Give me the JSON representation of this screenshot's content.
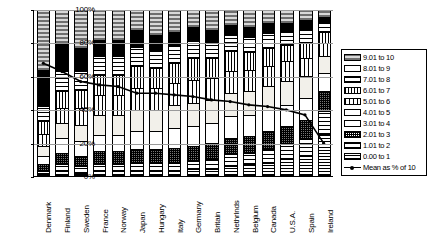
{
  "chart_data": {
    "type": "bar",
    "title": "",
    "xlabel": "",
    "ylabel": "",
    "ylim": [
      0,
      100
    ],
    "ytick_labels": [
      "0%",
      "20%",
      "40%",
      "60%",
      "80%",
      "100%"
    ],
    "ytick_values": [
      0,
      20,
      40,
      60,
      80,
      100
    ],
    "grid": true,
    "stacked": true,
    "normalized_percent": true,
    "legend_position": "right",
    "categories": [
      "Denmark",
      "Finland",
      "Sweden",
      "France",
      "Norway",
      "Japan",
      "Hungary",
      "Italy",
      "Germany",
      "Britain",
      "Nethrlnds",
      "Belgium",
      "Canada",
      "U.S.A.",
      "Spain",
      "Ireland"
    ],
    "series": [
      {
        "name": "9.01 to 10",
        "pattern": "grey-checker",
        "values": [
          36,
          20,
          23,
          18,
          18,
          12,
          15,
          13,
          10,
          12,
          9,
          10,
          8,
          8,
          6,
          4
        ]
      },
      {
        "name": "8.01 to 9",
        "pattern": "solid-black",
        "values": [
          22,
          17,
          14,
          10,
          10,
          10,
          9,
          8,
          8,
          7,
          6,
          6,
          6,
          5,
          6,
          3
        ]
      },
      {
        "name": "7.01 to 8",
        "pattern": "cross-hatch",
        "values": [
          9,
          12,
          11,
          11,
          11,
          12,
          11,
          11,
          11,
          10,
          10,
          9,
          9,
          8,
          8,
          6
        ]
      },
      {
        "name": "6.01 to 7",
        "pattern": "vertical-dense",
        "values": [
          8,
          10,
          11,
          12,
          12,
          13,
          12,
          12,
          13,
          12,
          12,
          11,
          11,
          10,
          9,
          7
        ]
      },
      {
        "name": "5.01 to 6",
        "pattern": "vertical-wide",
        "values": [
          7,
          9,
          10,
          12,
          12,
          13,
          13,
          13,
          14,
          13,
          13,
          13,
          12,
          12,
          11,
          8
        ]
      },
      {
        "name": "4.01 to 5",
        "pattern": "light-fill",
        "values": [
          6,
          9,
          10,
          12,
          12,
          13,
          13,
          14,
          14,
          14,
          14,
          14,
          14,
          14,
          13,
          10
        ]
      },
      {
        "name": "3.01 to 4",
        "pattern": "white-fill",
        "values": [
          5,
          9,
          9,
          10,
          10,
          11,
          11,
          12,
          12,
          12,
          13,
          13,
          13,
          13,
          13,
          11
        ]
      },
      {
        "name": "2.01 to 3",
        "pattern": "dark-speckle",
        "values": [
          4,
          7,
          6,
          8,
          8,
          8,
          8,
          9,
          9,
          10,
          10,
          10,
          11,
          11,
          12,
          12
        ]
      },
      {
        "name": "1.01 to 2",
        "pattern": "horizontal-wide",
        "values": [
          2,
          4,
          4,
          4,
          4,
          5,
          5,
          5,
          5,
          6,
          7,
          7,
          8,
          9,
          10,
          14
        ]
      },
      {
        "name": "0.00 to 1",
        "pattern": "horizontal-dense",
        "values": [
          1,
          3,
          2,
          3,
          3,
          3,
          3,
          3,
          4,
          4,
          6,
          7,
          8,
          10,
          12,
          25
        ]
      }
    ],
    "mean_line": {
      "name": "Mean as % of 10",
      "values": [
        68,
        63,
        57,
        55,
        54,
        50,
        50,
        49,
        48,
        46,
        45,
        43,
        42,
        40,
        37,
        20
      ]
    },
    "legend_items": [
      "9.01 to 10",
      "8.01 to 9",
      "7.01 to 8",
      "6.01 to 7",
      "5.01 to 6",
      "4.01 to 5",
      "3.01 to 4",
      "2.01 to 3",
      "1.01 to 2",
      "0.00 to 1"
    ],
    "mean_legend_label": "Mean as % of 10"
  }
}
